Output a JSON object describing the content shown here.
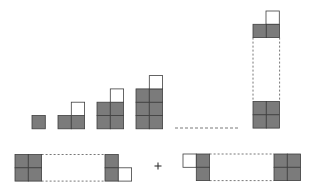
{
  "diagram": {
    "colors": {
      "fill": "#7b7b7b",
      "stroke": "#3f3f3f",
      "white": "#ffffff",
      "dash": "#555555"
    },
    "cell_size": 13.3,
    "sequence": [
      {
        "label": "figure-1",
        "gray_rows": 1,
        "gray_cols": 1,
        "has_top_white": false
      },
      {
        "label": "figure-2",
        "gray_rows": 1,
        "gray_cols": 2,
        "has_top_white": true
      },
      {
        "label": "figure-3",
        "gray_rows": 2,
        "gray_cols": 2,
        "has_top_white": true
      },
      {
        "label": "figure-4",
        "gray_rows": 3,
        "gray_cols": 2,
        "has_top_white": true
      }
    ],
    "ellipsis": "dashed-line",
    "general_figure": {
      "label": "figure-n",
      "orientation": "vertical"
    },
    "bottom": {
      "left_figure": {
        "label": "figure-n-rotated-left",
        "orientation": "horizontal"
      },
      "operator": "+",
      "right_figure": {
        "label": "figure-n-rotated-right",
        "orientation": "horizontal-mirrored"
      }
    }
  }
}
